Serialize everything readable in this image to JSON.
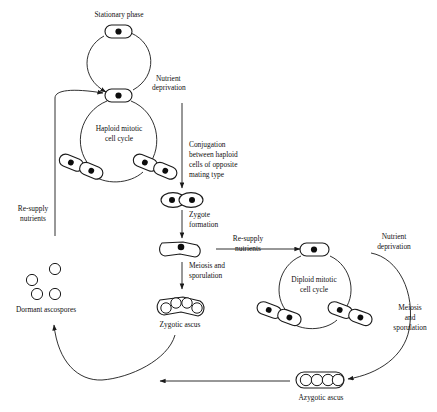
{
  "figure": {
    "type": "biological-cycle-diagram",
    "background_color": "#ffffff",
    "line_color": "#1a1a1a",
    "nucleus_color": "#0d0d0d"
  },
  "labels": {
    "stationary_phase": "Stationary phase",
    "nutrient_deprivation_top": "Nutrient",
    "nutrient_deprivation_top2": "deprivation",
    "haploid_cycle_1": "Haploid mitotic",
    "haploid_cycle_2": "cell cycle",
    "conjugation_1": "Conjugation",
    "conjugation_2": "between haploid",
    "conjugation_3": "cells of opposite",
    "conjugation_4": "mating type",
    "zygote_formation_1": "Zygote",
    "zygote_formation_2": "formation",
    "meiosis_sporulation_1": "Meiosis and",
    "meiosis_sporulation_2": "sporulation",
    "zygotic_ascus": "Zygotic ascus",
    "resupply_left_1": "Re-supply",
    "resupply_left_2": "nutrients",
    "dormant_ascospores": "Dormant ascospores",
    "resupply_mid_1": "Re-supply",
    "resupply_mid_2": "nutrients",
    "diploid_cycle_1": "Diploid mitotic",
    "diploid_cycle_2": "cell cycle",
    "nutrient_deprivation_right_1": "Nutrient",
    "nutrient_deprivation_right_2": "deprivation",
    "meiosis_right_1": "Meiosis",
    "meiosis_right_2": "and",
    "meiosis_right_3": "sporulation",
    "azygotic_ascus": "Azygotic ascus"
  },
  "cells": {
    "stationary_cell": {
      "nuclei": 1,
      "shape": "capsule"
    },
    "haploid_cell": {
      "nuclei": 1,
      "shape": "capsule"
    },
    "haploid_budding_left": {
      "nuclei": 2,
      "shape": "budding-pair"
    },
    "haploid_budding_right": {
      "nuclei": 2,
      "shape": "budding-pair"
    },
    "conjugating_pair": {
      "nuclei": 2,
      "shape": "fused-pair"
    },
    "zygote": {
      "nuclei": 1,
      "shape": "bent-zygote"
    },
    "zygotic_ascus": {
      "spores": 4,
      "shape": "bent-ascus"
    },
    "dormant_ascospores": {
      "spores": 4,
      "shape": "free-circles"
    },
    "diploid_cell": {
      "nuclei": 1,
      "shape": "capsule"
    },
    "diploid_budding_left": {
      "nuclei": 2,
      "shape": "budding-pair"
    },
    "diploid_budding_right": {
      "nuclei": 2,
      "shape": "budding-pair"
    },
    "azygotic_ascus": {
      "spores": 4,
      "shape": "straight-ascus"
    }
  }
}
